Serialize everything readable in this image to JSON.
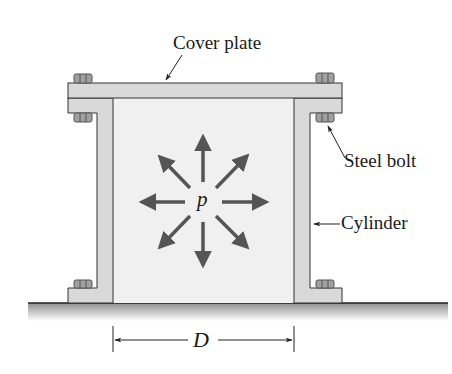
{
  "figure": {
    "type": "engineering-diagram"
  },
  "labels": {
    "cover_plate": "Cover plate",
    "steel_bolt": "Steel bolt",
    "cylinder": "Cylinder",
    "pressure": "p",
    "diameter": "D"
  },
  "colors": {
    "outline": "#2a2a2a",
    "metal_fill": "#d8d8d8",
    "interior_fill": "#efefef",
    "bolt_fill": "#9a9a9a",
    "arrow": "#555555",
    "ground_top": "#8a8a8a",
    "ground_bottom": "#ffffff"
  }
}
